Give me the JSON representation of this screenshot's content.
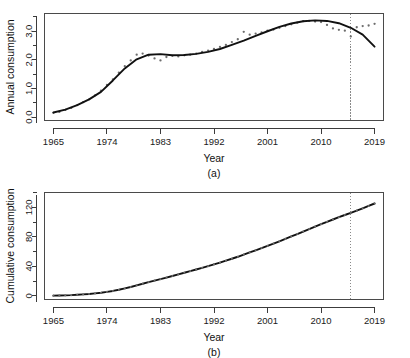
{
  "figure": {
    "panels": [
      {
        "tag": "(a)",
        "ylabel": "Annual consumption",
        "xlabel": "Year"
      },
      {
        "tag": "(b)",
        "ylabel": "Cumulative consumption",
        "xlabel": "Year"
      }
    ]
  },
  "chart_data": [
    {
      "type": "scatter",
      "panel": "(a)",
      "title": "",
      "xlabel": "Year",
      "ylabel": "Annual consumption",
      "xlim": [
        1963.5,
        2020.5
      ],
      "ylim": [
        -0.12,
        3.62
      ],
      "xticks": [
        1965,
        1974,
        1983,
        1992,
        2001,
        2010,
        2019
      ],
      "xticklabels": [
        "1965",
        "1974",
        "1983",
        "1992",
        "2001",
        "2010",
        "2019"
      ],
      "yticks": [
        0.0,
        1.0,
        2.0,
        3.0
      ],
      "yticklabels": [
        "0.0",
        "1.0",
        "2.0",
        "3.0"
      ],
      "yminorticks": [
        0.5,
        1.5,
        2.5,
        3.5
      ],
      "grid": false,
      "legend": null,
      "annotations": [
        {
          "type": "vline",
          "x": 2015,
          "style": "dotted",
          "color": "#8a8a8a"
        }
      ],
      "series": [
        {
          "name": "Observed annual consumption",
          "marker": "point",
          "color": "#6d6d6d",
          "x": [
            1965,
            1966,
            1967,
            1968,
            1969,
            1970,
            1971,
            1972,
            1973,
            1974,
            1975,
            1976,
            1977,
            1978,
            1979,
            1980,
            1981,
            1982,
            1983,
            1984,
            1985,
            1986,
            1987,
            1988,
            1989,
            1990,
            1991,
            1992,
            1993,
            1994,
            1995,
            1996,
            1997,
            1998,
            1999,
            2000,
            2001,
            2002,
            2003,
            2004,
            2005,
            2006,
            2007,
            2008,
            2009,
            2010,
            2011,
            2012,
            2013,
            2014,
            2015,
            2016,
            2017,
            2018,
            2019
          ],
          "y": [
            0.15,
            0.18,
            0.25,
            0.32,
            0.42,
            0.52,
            0.62,
            0.76,
            0.92,
            1.12,
            1.32,
            1.55,
            1.78,
            1.98,
            2.18,
            2.22,
            2.15,
            2.05,
            1.98,
            2.1,
            2.14,
            2.12,
            2.16,
            2.18,
            2.22,
            2.28,
            2.32,
            2.38,
            2.45,
            2.52,
            2.62,
            2.72,
            2.98,
            2.88,
            2.92,
            2.96,
            3.02,
            3.06,
            3.12,
            3.18,
            3.24,
            3.3,
            3.35,
            3.36,
            3.34,
            3.32,
            3.22,
            3.1,
            3.05,
            3.02,
            2.82,
            3.14,
            3.18,
            3.2,
            3.26
          ]
        },
        {
          "name": "Smoothed fit",
          "marker": "line",
          "color": "#111111",
          "x": [
            1965,
            1967,
            1969,
            1971,
            1973,
            1975,
            1977,
            1979,
            1981,
            1983,
            1985,
            1987,
            1989,
            1991,
            1993,
            1995,
            1997,
            1999,
            2001,
            2003,
            2005,
            2007,
            2009,
            2011,
            2013,
            2015,
            2017,
            2019
          ],
          "y": [
            0.16,
            0.26,
            0.42,
            0.62,
            0.88,
            1.28,
            1.7,
            2.02,
            2.18,
            2.2,
            2.16,
            2.17,
            2.21,
            2.28,
            2.38,
            2.52,
            2.67,
            2.84,
            3.0,
            3.15,
            3.27,
            3.35,
            3.38,
            3.36,
            3.28,
            3.12,
            2.88,
            2.46
          ]
        }
      ]
    },
    {
      "type": "line",
      "panel": "(b)",
      "title": "",
      "xlabel": "Year",
      "ylabel": "Cumulative consumption",
      "xlim": [
        1963.5,
        2020.5
      ],
      "ylim": [
        -5,
        140
      ],
      "xticks": [
        1965,
        1974,
        1983,
        1992,
        2001,
        2010,
        2019
      ],
      "xticklabels": [
        "1965",
        "1974",
        "1983",
        "1992",
        "2001",
        "2010",
        "2019"
      ],
      "yticks": [
        0,
        40,
        80,
        120
      ],
      "yticklabels": [
        "0",
        "40",
        "80",
        "120"
      ],
      "yminorticks": [
        20,
        60,
        100,
        140
      ],
      "grid": false,
      "legend": null,
      "annotations": [
        {
          "type": "vline",
          "x": 2015,
          "style": "dotted",
          "color": "#8a8a8a"
        }
      ],
      "series": [
        {
          "name": "Cumulative consumption",
          "marker": "line-points",
          "color": "#111111",
          "x": [
            1965,
            1966,
            1967,
            1968,
            1969,
            1970,
            1971,
            1972,
            1973,
            1974,
            1975,
            1976,
            1977,
            1978,
            1979,
            1980,
            1981,
            1982,
            1983,
            1984,
            1985,
            1986,
            1987,
            1988,
            1989,
            1990,
            1991,
            1992,
            1993,
            1994,
            1995,
            1996,
            1997,
            1998,
            1999,
            2000,
            2001,
            2002,
            2003,
            2004,
            2005,
            2006,
            2007,
            2008,
            2009,
            2010,
            2011,
            2012,
            2013,
            2014,
            2015,
            2016,
            2017,
            2018,
            2019
          ],
          "y": [
            0.2,
            0.4,
            0.6,
            0.9,
            1.4,
            1.9,
            2.5,
            3.3,
            4.2,
            5.3,
            6.6,
            8.2,
            10.0,
            12.0,
            14.2,
            16.4,
            18.5,
            20.6,
            22.6,
            24.7,
            26.8,
            29.0,
            31.2,
            33.4,
            35.6,
            37.9,
            40.2,
            42.6,
            45.0,
            47.6,
            50.2,
            52.9,
            55.9,
            58.8,
            61.7,
            64.7,
            67.7,
            70.8,
            73.9,
            77.1,
            80.4,
            83.7,
            87.1,
            90.5,
            93.8,
            97.1,
            100.3,
            103.4,
            106.5,
            109.5,
            112.3,
            115.4,
            118.6,
            121.8,
            125.1
          ]
        }
      ]
    }
  ]
}
